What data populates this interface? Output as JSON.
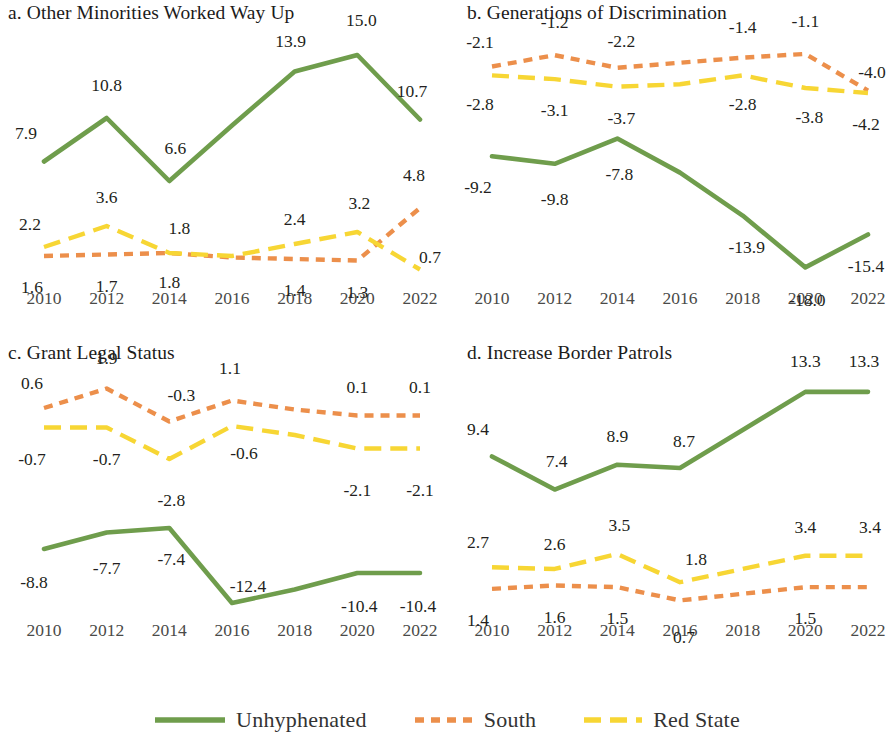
{
  "figure": {
    "background": "#ffffff",
    "width": 893,
    "height": 748
  },
  "legend": {
    "position": "bottom-center",
    "entries": [
      {
        "label": "Unhyphenated",
        "color": "#6f9d4c",
        "style": "solid"
      },
      {
        "label": "South",
        "color": "#ec8f4b",
        "style": "dashed"
      },
      {
        "label": "Red State",
        "color": "#f7d634",
        "style": "dashed-long"
      }
    ]
  },
  "chart_data": [
    {
      "type": "line",
      "panel": "a",
      "title": "a. Other Minorities Worked Way Up",
      "xlabel": "",
      "ylabel": "",
      "grid": false,
      "categories": [
        2010,
        2012,
        2014,
        2016,
        2018,
        2020,
        2022
      ],
      "tick_labels": [
        "2010",
        "2012",
        "2014",
        "2016",
        "2018",
        "2020",
        "2022"
      ],
      "ylim": [
        0.0,
        16.0
      ],
      "series": [
        {
          "name": "Unhyphenated",
          "color": "#6f9d4c",
          "style": "solid",
          "values": [
            7.9,
            10.8,
            6.6,
            10.3,
            13.9,
            15.0,
            10.7
          ],
          "labels": [
            "7.9",
            "10.8",
            "6.6",
            "",
            "13.9",
            "15.0",
            "10.7"
          ]
        },
        {
          "name": "South",
          "color": "#ec8f4b",
          "style": "dashed",
          "values": [
            1.6,
            1.7,
            1.8,
            1.5,
            1.4,
            1.3,
            4.8
          ],
          "labels": [
            "1.6",
            "1.7",
            "1.8",
            "",
            "1.4",
            "1.3",
            "4.8"
          ]
        },
        {
          "name": "Red State",
          "color": "#f7d634",
          "style": "dashed-long",
          "values": [
            2.2,
            3.6,
            1.8,
            1.6,
            2.4,
            3.2,
            0.7
          ],
          "labels": [
            "2.2",
            "3.6",
            "1.8",
            "",
            "2.4",
            "3.2",
            "0.7"
          ]
        }
      ]
    },
    {
      "type": "line",
      "panel": "b",
      "title": "b. Generations of Discrimination",
      "xlabel": "",
      "ylabel": "",
      "grid": false,
      "categories": [
        2010,
        2012,
        2014,
        2016,
        2018,
        2020,
        2022
      ],
      "tick_labels": [
        "2010",
        "2012",
        "2014",
        "2016",
        "2018",
        "2020",
        "2022"
      ],
      "ylim": [
        -19.0,
        0.0
      ],
      "series": [
        {
          "name": "Unhyphenated",
          "color": "#6f9d4c",
          "style": "solid",
          "values": [
            -9.2,
            -9.8,
            -7.8,
            -10.5,
            -13.9,
            -18.0,
            -15.4
          ],
          "labels": [
            "-9.2",
            "-9.8",
            "-7.8",
            "",
            "-13.9",
            "-18.0",
            "-15.4"
          ]
        },
        {
          "name": "South",
          "color": "#ec8f4b",
          "style": "dashed",
          "values": [
            -2.1,
            -1.2,
            -2.2,
            -1.8,
            -1.4,
            -1.1,
            -4.0
          ],
          "labels": [
            "-2.1",
            "-1.2",
            "-2.2",
            "",
            "-1.4",
            "-1.1",
            "-4.0"
          ]
        },
        {
          "name": "Red State",
          "color": "#f7d634",
          "style": "dashed-long",
          "values": [
            -2.8,
            -3.1,
            -3.7,
            -3.5,
            -2.8,
            -3.8,
            -4.2
          ],
          "labels": [
            "-2.8",
            "-3.1",
            "-3.7",
            "",
            "-2.8",
            "-3.8",
            "-4.2"
          ]
        }
      ]
    },
    {
      "type": "line",
      "panel": "c",
      "title": "c. Grant Legal Status",
      "xlabel": "",
      "ylabel": "",
      "grid": false,
      "categories": [
        2010,
        2012,
        2014,
        2016,
        2018,
        2020,
        2022
      ],
      "tick_labels": [
        "2010",
        "2012",
        "2014",
        "2016",
        "2018",
        "2020",
        "2022"
      ],
      "ylim": [
        -13.0,
        3.0
      ],
      "series": [
        {
          "name": "Unhyphenated",
          "color": "#6f9d4c",
          "style": "solid",
          "values": [
            -8.8,
            -7.7,
            -7.4,
            -12.4,
            -11.5,
            -10.4,
            -10.4
          ],
          "labels": [
            "-8.8",
            "-7.7",
            "-7.4",
            "-12.4",
            "",
            "-10.4",
            "-10.4"
          ]
        },
        {
          "name": "South",
          "color": "#ec8f4b",
          "style": "dashed",
          "values": [
            0.6,
            1.9,
            -0.3,
            1.1,
            0.5,
            0.1,
            0.1
          ],
          "labels": [
            "0.6",
            "1.9",
            "-0.3",
            "1.1",
            "",
            "0.1",
            "0.1"
          ]
        },
        {
          "name": "Red State",
          "color": "#f7d634",
          "style": "dashed-long",
          "values": [
            -0.7,
            -0.7,
            -2.8,
            -0.6,
            -1.2,
            -2.1,
            -2.1
          ],
          "labels": [
            "-0.7",
            "-0.7",
            "-2.8",
            "-0.6",
            "",
            "-2.1",
            "-2.1"
          ]
        }
      ]
    },
    {
      "type": "line",
      "panel": "d",
      "title": "d. Increase Border Patrols",
      "xlabel": "",
      "ylabel": "",
      "grid": false,
      "categories": [
        2010,
        2012,
        2014,
        2016,
        2018,
        2020,
        2022
      ],
      "tick_labels": [
        "2010",
        "2012",
        "2014",
        "2016",
        "2018",
        "2020",
        "2022"
      ],
      "ylim": [
        0.0,
        14.5
      ],
      "series": [
        {
          "name": "Unhyphenated",
          "color": "#6f9d4c",
          "style": "solid",
          "values": [
            9.4,
            7.4,
            8.9,
            8.7,
            11.0,
            13.3,
            13.3
          ],
          "labels": [
            "9.4",
            "7.4",
            "8.9",
            "8.7",
            "",
            "13.3",
            "13.3"
          ]
        },
        {
          "name": "South",
          "color": "#ec8f4b",
          "style": "dashed",
          "values": [
            1.4,
            1.6,
            1.5,
            0.7,
            1.1,
            1.5,
            1.5
          ],
          "labels": [
            "1.4",
            "1.6",
            "1.5",
            "0.7",
            "",
            "1.5",
            ""
          ]
        },
        {
          "name": "Red State",
          "color": "#f7d634",
          "style": "dashed-long",
          "values": [
            2.7,
            2.6,
            3.5,
            1.8,
            2.6,
            3.4,
            3.4
          ],
          "labels": [
            "2.7",
            "2.6",
            "3.5",
            "1.8",
            "",
            "3.4",
            "3.4"
          ]
        }
      ]
    }
  ],
  "label_overrides": {
    "a": {
      "Unhyphenated": [
        {
          "i": 0,
          "dx": -18,
          "dy": -30
        },
        {
          "i": 1,
          "dx": 0,
          "dy": -34
        },
        {
          "i": 2,
          "dx": 6,
          "dy": -34
        },
        {
          "i": 4,
          "dx": -4,
          "dy": -32
        },
        {
          "i": 5,
          "dx": 4,
          "dy": -36
        },
        {
          "i": 6,
          "dx": -8,
          "dy": -30
        }
      ],
      "South": [
        {
          "i": 0,
          "dx": -12,
          "dy": 30
        },
        {
          "i": 1,
          "dx": 0,
          "dy": 30
        },
        {
          "i": 2,
          "dx": 0,
          "dy": 28
        },
        {
          "i": 4,
          "dx": 0,
          "dy": 30
        },
        {
          "i": 5,
          "dx": 0,
          "dy": 30
        },
        {
          "i": 6,
          "dx": -6,
          "dy": -34
        }
      ],
      "Red State": [
        {
          "i": 0,
          "dx": -14,
          "dy": -24
        },
        {
          "i": 1,
          "dx": 0,
          "dy": -30
        },
        {
          "i": 2,
          "dx": 10,
          "dy": -26
        },
        {
          "i": 4,
          "dx": 0,
          "dy": -26
        },
        {
          "i": 5,
          "dx": 2,
          "dy": -30
        },
        {
          "i": 6,
          "dx": 10,
          "dy": -14
        }
      ]
    },
    "b": {
      "Unhyphenated": [
        {
          "i": 0,
          "dx": -14,
          "dy": 30
        },
        {
          "i": 1,
          "dx": 0,
          "dy": 34
        },
        {
          "i": 2,
          "dx": 2,
          "dy": 34
        },
        {
          "i": 4,
          "dx": 4,
          "dy": 30
        },
        {
          "i": 5,
          "dx": 2,
          "dy": 32
        },
        {
          "i": 6,
          "dx": -2,
          "dy": 30
        }
      ],
      "South": [
        {
          "i": 0,
          "dx": -12,
          "dy": -26
        },
        {
          "i": 1,
          "dx": 0,
          "dy": -34
        },
        {
          "i": 2,
          "dx": 4,
          "dy": -28
        },
        {
          "i": 4,
          "dx": 0,
          "dy": -32
        },
        {
          "i": 5,
          "dx": 0,
          "dy": -34
        },
        {
          "i": 6,
          "dx": 4,
          "dy": -20
        }
      ],
      "Red State": [
        {
          "i": 0,
          "dx": -12,
          "dy": 28
        },
        {
          "i": 1,
          "dx": 0,
          "dy": 30
        },
        {
          "i": 2,
          "dx": 4,
          "dy": 30
        },
        {
          "i": 4,
          "dx": 0,
          "dy": 28
        },
        {
          "i": 5,
          "dx": 4,
          "dy": 28
        },
        {
          "i": 6,
          "dx": -2,
          "dy": 30
        }
      ]
    },
    "c": {
      "Unhyphenated": [
        {
          "i": 0,
          "dx": -10,
          "dy": 32
        },
        {
          "i": 1,
          "dx": 0,
          "dy": 34
        },
        {
          "i": 2,
          "dx": 2,
          "dy": 30
        },
        {
          "i": 3,
          "dx": 16,
          "dy": -18
        },
        {
          "i": 5,
          "dx": 2,
          "dy": 32
        },
        {
          "i": 6,
          "dx": -2,
          "dy": 32
        }
      ],
      "South": [
        {
          "i": 0,
          "dx": -12,
          "dy": -26
        },
        {
          "i": 1,
          "dx": 0,
          "dy": -32
        },
        {
          "i": 2,
          "dx": 12,
          "dy": -28
        },
        {
          "i": 3,
          "dx": -2,
          "dy": -34
        },
        {
          "i": 5,
          "dx": 0,
          "dy": -30
        },
        {
          "i": 6,
          "dx": 0,
          "dy": -30
        }
      ],
      "Red State": [
        {
          "i": 0,
          "dx": -12,
          "dy": 30
        },
        {
          "i": 1,
          "dx": 0,
          "dy": 30
        },
        {
          "i": 2,
          "dx": 2,
          "dy": 40
        },
        {
          "i": 3,
          "dx": 12,
          "dy": 26
        },
        {
          "i": 5,
          "dx": 0,
          "dy": 40
        },
        {
          "i": 6,
          "dx": 0,
          "dy": 40
        }
      ]
    },
    "d": {
      "Unhyphenated": [
        {
          "i": 0,
          "dx": -14,
          "dy": -28
        },
        {
          "i": 1,
          "dx": 2,
          "dy": -30
        },
        {
          "i": 2,
          "dx": 0,
          "dy": -30
        },
        {
          "i": 3,
          "dx": 4,
          "dy": -28
        },
        {
          "i": 5,
          "dx": 0,
          "dy": -32
        },
        {
          "i": 6,
          "dx": -4,
          "dy": -32
        }
      ],
      "South": [
        {
          "i": 0,
          "dx": -14,
          "dy": 30
        },
        {
          "i": 1,
          "dx": 0,
          "dy": 30
        },
        {
          "i": 2,
          "dx": 0,
          "dy": 30
        },
        {
          "i": 3,
          "dx": 4,
          "dy": 36
        },
        {
          "i": 5,
          "dx": 0,
          "dy": 30
        },
        {
          "i": 6,
          "dx": 0,
          "dy": 30
        }
      ],
      "Red State": [
        {
          "i": 0,
          "dx": -14,
          "dy": -26
        },
        {
          "i": 1,
          "dx": 0,
          "dy": -26
        },
        {
          "i": 2,
          "dx": 2,
          "dy": -30
        },
        {
          "i": 3,
          "dx": 16,
          "dy": -24
        },
        {
          "i": 5,
          "dx": 0,
          "dy": -30
        },
        {
          "i": 6,
          "dx": 2,
          "dy": -30
        }
      ]
    }
  }
}
